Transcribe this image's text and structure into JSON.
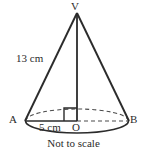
{
  "figure": {
    "caption": "Not to scale",
    "stroke_color": "#2b2b2b",
    "dashed_color": "#4a4a4a",
    "background_color": "#ffffff"
  },
  "labels": {
    "apex": "V",
    "base_left": "A",
    "base_right": "B",
    "center": "O",
    "slant_height": "13 cm",
    "radius": "5 cm"
  },
  "geometry": {
    "apex": {
      "x": 77,
      "y": 12
    },
    "center": {
      "x": 77,
      "y": 121
    },
    "base_left": {
      "x": 22,
      "y": 121
    },
    "base_right": {
      "x": 125,
      "y": 121
    },
    "base_rx": 51.5,
    "base_ry": 12,
    "right_angle_marker": {
      "x": 64,
      "y": 108,
      "size": 13
    }
  },
  "measurements": {
    "slant_height_value": 13,
    "slant_height_unit": "cm",
    "radius_value": 5,
    "radius_unit": "cm"
  },
  "icons": {
    "right_angle": "right-angle-marker"
  }
}
